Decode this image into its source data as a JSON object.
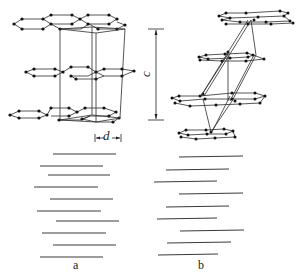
{
  "figure": {
    "panels": [
      {
        "id": "a",
        "label": "a",
        "description": "Hexagonal graphite (ABAB stacking) with unit cell",
        "dimension_label": "d",
        "layers": 3,
        "edge_view_lines": 10
      },
      {
        "id": "b",
        "label": "b",
        "description": "Rhombohedral graphite (ABCABC stacking) with rhombohedral cell",
        "dimension_label": "c",
        "layers": 4,
        "edge_view_lines": 9
      }
    ],
    "colors": {
      "line": "#2b2b2b",
      "atom": "#111111",
      "background": "#ffffff"
    }
  }
}
